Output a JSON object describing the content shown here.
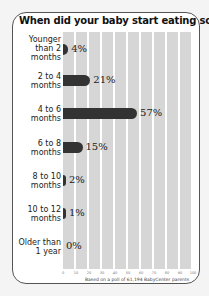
{
  "title": "When did your baby start eating solids?",
  "footer": "Based on a poll of 61,194 BabyCenter parents",
  "colors": {
    "bar": "#333333",
    "grid": "#d6d6d6",
    "background": "#ffffff",
    "border": "#555555"
  },
  "chart_data": {
    "type": "bar",
    "orientation": "horizontal",
    "title": "When did your baby start eating solids?",
    "categories": [
      "Younger than 2 months",
      "2 to 4 months",
      "4 to 6 months",
      "6 to 8 months",
      "8 to 10 months",
      "10 to 12 months",
      "Older than 1 year"
    ],
    "values": [
      4,
      21,
      57,
      15,
      2,
      1,
      0
    ],
    "value_labels": [
      "4%",
      "21%",
      "57%",
      "15%",
      "2%",
      "1%",
      "0%"
    ],
    "xlabel": "",
    "ylabel": "",
    "xlim": [
      0,
      100
    ],
    "xticks": [
      "0",
      "10",
      "20",
      "30",
      "40",
      "50",
      "60",
      "70",
      "80",
      "90",
      "100"
    ],
    "grid": true,
    "annotation": "Based on a poll of 61,194 BabyCenter parents"
  },
  "rows": [
    {
      "label_lines": [
        "Younger",
        "than 2",
        "months"
      ],
      "value": 4,
      "value_label": "4%"
    },
    {
      "label_lines": [
        "2 to 4",
        "months"
      ],
      "value": 21,
      "value_label": "21%"
    },
    {
      "label_lines": [
        "4 to 6",
        "months"
      ],
      "value": 57,
      "value_label": "57%"
    },
    {
      "label_lines": [
        "6 to 8",
        "months"
      ],
      "value": 15,
      "value_label": "15%"
    },
    {
      "label_lines": [
        "8 to 10",
        "months"
      ],
      "value": 2,
      "value_label": "2%"
    },
    {
      "label_lines": [
        "10 to 12",
        "months"
      ],
      "value": 1,
      "value_label": "1%"
    },
    {
      "label_lines": [
        "Older than",
        "1 year"
      ],
      "value": 0,
      "value_label": "0%"
    }
  ]
}
